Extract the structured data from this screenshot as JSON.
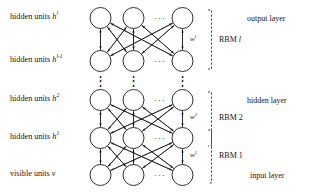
{
  "figure": {
    "type": "deep-belief-network-diagram",
    "title": "",
    "columns_per_layer": 3,
    "horizontal_ellipsis": "···",
    "vertical_ellipsis": "⋮"
  },
  "left_labels": [
    {
      "id": "layer-hl",
      "prefix": "hidden units ",
      "symbol": "h",
      "sup": "l",
      "y": 18
    },
    {
      "id": "layer-hlm1",
      "prefix": "hidden units ",
      "symbol": "h",
      "sup": "l-1",
      "y": 61
    },
    {
      "id": "layer-h2",
      "prefix": "hidden units ",
      "symbol": "h",
      "sup": "2",
      "y": 100
    },
    {
      "id": "layer-h1",
      "prefix": "hidden units ",
      "symbol": "h",
      "sup": "1",
      "y": 138
    },
    {
      "id": "layer-v",
      "prefix": "visible units ",
      "symbol": "v",
      "sup": "",
      "y": 175
    }
  ],
  "right_labels": [
    {
      "id": "output-layer",
      "text": "output layer",
      "y": 18
    },
    {
      "id": "hidden-layer",
      "text": "hidden layer",
      "y": 100
    },
    {
      "id": "input-layer",
      "text": "input layer",
      "y": 175
    }
  ],
  "weights": [
    {
      "id": "w-l",
      "symbol": "w",
      "sup": "l",
      "y": 40
    },
    {
      "id": "w-2",
      "symbol": "w",
      "sup": "2",
      "y": 118
    },
    {
      "id": "w-1",
      "symbol": "w",
      "sup": "1",
      "y": 156
    }
  ],
  "rbm_groups": [
    {
      "id": "rbm-l",
      "text": "RBM ",
      "index": "l",
      "italic_index": true,
      "y": 40,
      "top": 18,
      "bottom": 61
    },
    {
      "id": "rbm-2",
      "text": "RBM ",
      "index": "2",
      "italic_index": false,
      "y": 118,
      "top": 100,
      "bottom": 138
    },
    {
      "id": "rbm-1",
      "text": "RBM ",
      "index": "1",
      "italic_index": false,
      "y": 156,
      "top": 138,
      "bottom": 175
    }
  ],
  "colors": {
    "stroke": "#1a1a1a",
    "text": "#141414",
    "background": "#ffffff"
  }
}
